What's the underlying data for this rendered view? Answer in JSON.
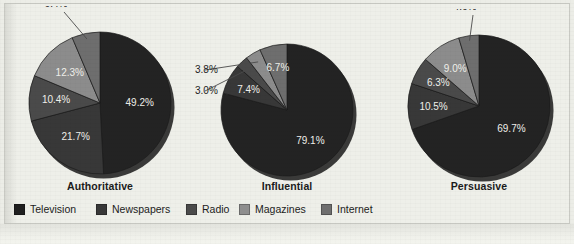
{
  "figure": {
    "background_color": "#eceded",
    "frame_border_color": "#c9cac4"
  },
  "legend": {
    "position": "bottom-left",
    "items": [
      {
        "label": "Television",
        "color": "#1f1f1f",
        "left": 0
      },
      {
        "label": "Newspapers",
        "color": "#383838",
        "left": 82
      },
      {
        "label": "Radio",
        "color": "#4a4a4a",
        "left": 172
      },
      {
        "label": "Magazines",
        "color": "#8e8e8e",
        "left": 225
      },
      {
        "label": "Internet",
        "color": "#6e6e6e",
        "left": 307
      }
    ]
  },
  "charts": [
    {
      "title": "Authoritative",
      "center_x": 100,
      "center_y": 103,
      "radius": 71,
      "title_top": 180,
      "title_left": 40,
      "title_width": 120,
      "slices": [
        {
          "name": "Television",
          "value": 49.2,
          "label": "49.2%",
          "color": "#232323",
          "label_mode": "inside",
          "label_r": 0.56
        },
        {
          "name": "Newspapers",
          "value": 21.7,
          "label": "21.7%",
          "color": "#383838",
          "label_mode": "inside",
          "label_r": 0.58
        },
        {
          "name": "Radio",
          "value": 10.4,
          "label": "10.4%",
          "color": "#4a4a4a",
          "label_mode": "inside",
          "label_r": 0.62
        },
        {
          "name": "Magazines",
          "value": 12.3,
          "label": "12.3%",
          "color": "#8c8c8c",
          "label_mode": "inside",
          "label_r": 0.6
        },
        {
          "name": "Internet",
          "value": 6.4,
          "label": "6.4%",
          "color": "#6e6e6e",
          "label_mode": "callout",
          "callout_x": -44,
          "callout_y": -96,
          "leader_r": 0.92
        }
      ]
    },
    {
      "title": "Influential",
      "center_x": 287,
      "center_y": 110,
      "radius": 66,
      "title_top": 180,
      "title_left": 227,
      "title_width": 120,
      "slices": [
        {
          "name": "Television",
          "value": 79.1,
          "label": "79.1%",
          "color": "#232323",
          "label_mode": "inside",
          "label_r": 0.58
        },
        {
          "name": "Newspapers",
          "value": 7.4,
          "label": "7.4%",
          "color": "#383838",
          "label_mode": "inside",
          "label_r": 0.66
        },
        {
          "name": "Radio",
          "value": 3.0,
          "label": "3.0%",
          "color": "#4a4a4a",
          "label_mode": "callout",
          "callout_x": -92,
          "callout_y": -16,
          "leader_r": 0.85
        },
        {
          "name": "Magazines",
          "value": 3.8,
          "label": "3.8%",
          "color": "#8c8c8c",
          "label_mode": "callout",
          "callout_x": -92,
          "callout_y": -37,
          "leader_r": 0.85
        },
        {
          "name": "Internet",
          "value": 6.7,
          "label": "6.7%",
          "color": "#6e6e6e",
          "label_mode": "inside",
          "label_r": 0.66
        }
      ]
    },
    {
      "title": "Persuasive",
      "center_x": 479,
      "center_y": 106,
      "radius": 71,
      "title_top": 180,
      "title_left": 419,
      "title_width": 120,
      "slices": [
        {
          "name": "Television",
          "value": 69.7,
          "label": "69.7%",
          "color": "#232323",
          "label_mode": "inside",
          "label_r": 0.56
        },
        {
          "name": "Newspapers",
          "value": 10.5,
          "label": "10.5%",
          "color": "#383838",
          "label_mode": "inside",
          "label_r": 0.64
        },
        {
          "name": "Radio",
          "value": 6.3,
          "label": "6.3%",
          "color": "#4a4a4a",
          "label_mode": "inside",
          "label_r": 0.66
        },
        {
          "name": "Magazines",
          "value": 9.0,
          "label": "9.0%",
          "color": "#8c8c8c",
          "label_mode": "inside",
          "label_r": 0.62
        },
        {
          "name": "Internet",
          "value": 4.6,
          "label": "4.6%",
          "color": "#6e6e6e",
          "label_mode": "callout",
          "callout_x": -14,
          "callout_y": -96,
          "leader_r": 0.93
        }
      ]
    }
  ],
  "chart_data": {
    "type": "pie",
    "title": "",
    "subtitle": "",
    "xlabel": "",
    "ylabel": "",
    "grid": false,
    "legend_position": "bottom-left",
    "value_unit": "percent",
    "categories": [
      "Television",
      "Newspapers",
      "Radio",
      "Magazines",
      "Internet"
    ],
    "series": [
      {
        "name": "Authoritative",
        "values": [
          49.2,
          21.7,
          10.4,
          12.3,
          6.4
        ],
        "labels": [
          "49.2%",
          "21.7%",
          "10.4%",
          "12.3%",
          "6.4%"
        ]
      },
      {
        "name": "Influential",
        "values": [
          79.1,
          7.4,
          3.0,
          3.8,
          6.7
        ],
        "labels": [
          "79.1%",
          "7.4%",
          "3.0%",
          "3.8%",
          "6.7%"
        ]
      },
      {
        "name": "Persuasive",
        "values": [
          69.7,
          10.5,
          6.3,
          9.0,
          4.6
        ],
        "labels": [
          "69.7%",
          "10.5%",
          "6.3%",
          "9.0%",
          "4.6%"
        ]
      }
    ],
    "slice_colors": [
      "#1f1f1f",
      "#383838",
      "#4a4a4a",
      "#8e8e8e",
      "#6e6e6e"
    ],
    "annotations": [
      "Authoritative: 6.4% Internet slice has leader line to label above chart",
      "Influential: 3.8% Magazines and 3.0% Radio slices have leader lines to labels at left",
      "Persuasive: 4.6% Internet slice has leader line to label above chart"
    ]
  }
}
